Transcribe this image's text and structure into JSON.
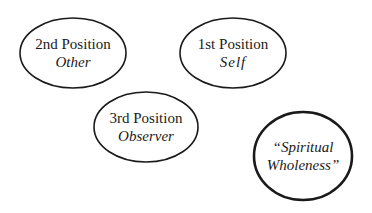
{
  "diagram": {
    "nodes": [
      {
        "id": "second",
        "title": "2nd Position",
        "subtitle": "Other"
      },
      {
        "id": "first",
        "title": "1st Position",
        "subtitle": "Self"
      },
      {
        "id": "third",
        "title": "3rd Position",
        "subtitle": "Observer"
      },
      {
        "id": "spiritual",
        "title": "“Spiritual",
        "subtitle": "Wholeness”"
      }
    ],
    "colors": {
      "stroke": "#1a1a1a",
      "background": "#ffffff"
    }
  }
}
